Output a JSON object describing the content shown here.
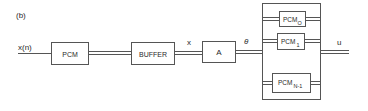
{
  "figure": {
    "panel_label": "(b)"
  },
  "signals": {
    "input": "x(n)",
    "buffered": "x",
    "theta": "θ",
    "output": "u"
  },
  "blocks": {
    "pcm": "PCM",
    "buffer": "BUFFER",
    "a": "A",
    "bank": [
      {
        "base": "PCM",
        "sub": "O"
      },
      {
        "base": "PCM",
        "sub": "1"
      },
      {
        "base": "PCM",
        "sub": "N-1"
      }
    ]
  },
  "colors": {
    "stroke": "#555555",
    "text": "#2a2a2a",
    "background": "#ffffff"
  }
}
